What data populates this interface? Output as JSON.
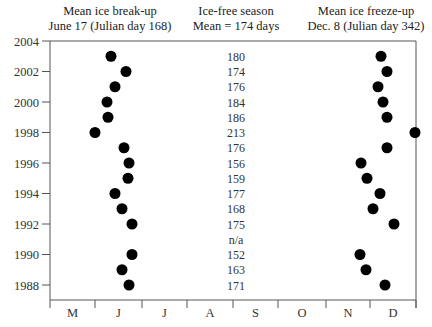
{
  "headers": {
    "breakup": {
      "line1": "Mean ice break-up",
      "line2": "June 17 (Julian day 168)"
    },
    "season": {
      "line1": "Ice-free season",
      "line2": "Mean = 174 days"
    },
    "freezeup": {
      "line1": "Mean ice freeze-up",
      "line2": "Dec. 8 (Julian day 342)"
    }
  },
  "chart_data": {
    "type": "scatter",
    "xlabel": "Month",
    "ylabel": "Year",
    "x_ticks": [
      "M",
      "J",
      "J",
      "A",
      "S",
      "O",
      "N",
      "D"
    ],
    "y_ticks": [
      2004,
      2002,
      2000,
      1998,
      1996,
      1994,
      1992,
      1990,
      1988
    ],
    "ylim": [
      1987,
      2004
    ],
    "grid": false,
    "series": [
      {
        "name": "Ice break-up",
        "points": [
          {
            "year": 2003,
            "approx_julian_day": 163
          },
          {
            "year": 2002,
            "approx_julian_day": 173
          },
          {
            "year": 2001,
            "approx_julian_day": 166
          },
          {
            "year": 2000,
            "approx_julian_day": 160
          },
          {
            "year": 1999,
            "approx_julian_day": 161
          },
          {
            "year": 1998,
            "approx_julian_day": 152
          },
          {
            "year": 1997,
            "approx_julian_day": 171
          },
          {
            "year": 1996,
            "approx_julian_day": 175
          },
          {
            "year": 1995,
            "approx_julian_day": 174
          },
          {
            "year": 1994,
            "approx_julian_day": 165
          },
          {
            "year": 1993,
            "approx_julian_day": 170
          },
          {
            "year": 1992,
            "approx_julian_day": 177
          },
          {
            "year": 1990,
            "approx_julian_day": 177
          },
          {
            "year": 1989,
            "approx_julian_day": 170
          },
          {
            "year": 1988,
            "approx_julian_day": 175
          }
        ]
      },
      {
        "name": "Ice-free season (days)",
        "points": [
          {
            "year": 2003,
            "label": "180"
          },
          {
            "year": 2002,
            "label": "174"
          },
          {
            "year": 2001,
            "label": "176"
          },
          {
            "year": 2000,
            "label": "184"
          },
          {
            "year": 1999,
            "label": "186"
          },
          {
            "year": 1998,
            "label": "213"
          },
          {
            "year": 1997,
            "label": "176"
          },
          {
            "year": 1996,
            "label": "156"
          },
          {
            "year": 1995,
            "label": "159"
          },
          {
            "year": 1994,
            "label": "177"
          },
          {
            "year": 1993,
            "label": "168"
          },
          {
            "year": 1992,
            "label": "175"
          },
          {
            "year": 1991,
            "label": "n/a"
          },
          {
            "year": 1990,
            "label": "152"
          },
          {
            "year": 1989,
            "label": "163"
          },
          {
            "year": 1988,
            "label": "171"
          }
        ]
      },
      {
        "name": "Ice freeze-up",
        "points": [
          {
            "year": 2003,
            "approx_julian_day": 343
          },
          {
            "year": 2002,
            "approx_julian_day": 347
          },
          {
            "year": 2001,
            "approx_julian_day": 341
          },
          {
            "year": 2000,
            "approx_julian_day": 344
          },
          {
            "year": 1999,
            "approx_julian_day": 347
          },
          {
            "year": 1998,
            "approx_julian_day": 365
          },
          {
            "year": 1997,
            "approx_julian_day": 347
          },
          {
            "year": 1996,
            "approx_julian_day": 330
          },
          {
            "year": 1995,
            "approx_julian_day": 334
          },
          {
            "year": 1994,
            "approx_julian_day": 342
          },
          {
            "year": 1993,
            "approx_julian_day": 338
          },
          {
            "year": 1992,
            "approx_julian_day": 351
          },
          {
            "year": 1990,
            "approx_julian_day": 329
          },
          {
            "year": 1989,
            "approx_julian_day": 333
          },
          {
            "year": 1988,
            "approx_julian_day": 345
          }
        ]
      }
    ]
  },
  "layout": {
    "plot": {
      "left": 50,
      "right": 416,
      "top": 41,
      "bottom": 300
    },
    "x_tick_px": [
      50,
      95,
      142,
      187,
      233,
      278,
      326,
      370,
      416
    ],
    "year_top": 2004,
    "y_top_px": 41,
    "px_per_year": 15.25,
    "breakup_px": {
      "2003": 111,
      "2002": 126,
      "2001": 115,
      "2000": 107,
      "1999": 108,
      "1998": 95,
      "1997": 124,
      "1996": 129,
      "1995": 128,
      "1994": 115,
      "1993": 122,
      "1992": 132,
      "1990": 132,
      "1989": 122,
      "1988": 129
    },
    "freezeup_px": {
      "2003": 381,
      "2002": 387,
      "2001": 378,
      "2000": 383,
      "1999": 387,
      "1998": 415,
      "1997": 387,
      "1996": 361,
      "1995": 367,
      "1994": 380,
      "1993": 373,
      "1992": 394,
      "1990": 360,
      "1989": 366,
      "1988": 385
    },
    "season_x_px": 236,
    "dot_radius": 5.5,
    "dot_color": "#000000",
    "axis_color": "#555555"
  }
}
